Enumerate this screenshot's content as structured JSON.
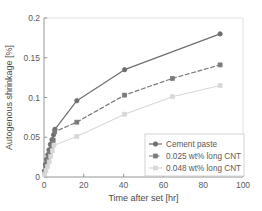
{
  "chart_data": {
    "type": "line",
    "title": "",
    "xlabel": "Time after set [hr]",
    "ylabel": "Autogenous shrinkage [%]",
    "xlim": [
      0,
      100
    ],
    "ylim": [
      0,
      0.2
    ],
    "xticks": [
      0,
      20,
      40,
      60,
      80,
      100
    ],
    "yticks": [
      0,
      0.05,
      0.1,
      0.15,
      0.2
    ],
    "xticklabels": [
      "0",
      "20",
      "40",
      "60",
      "80",
      "100"
    ],
    "yticklabels": [
      "0",
      "0.05",
      "0.1",
      "0.15",
      "0.2"
    ],
    "grid": false,
    "legend_position": "lower right",
    "series": [
      {
        "name": "Cement paste",
        "color": "#6e6e6e",
        "linestyle": "solid",
        "marker": "circle",
        "x": [
          0.3,
          0.8,
          1.3,
          1.9,
          2.5,
          3.2,
          4.0,
          4.8,
          5.5,
          16.5,
          40.5,
          88.5
        ],
        "y": [
          0.008,
          0.016,
          0.022,
          0.028,
          0.034,
          0.041,
          0.047,
          0.053,
          0.06,
          0.096,
          0.135,
          0.18
        ]
      },
      {
        "name": "0.025 wt% long CNT",
        "color": "#7a7a7a",
        "linestyle": "dashed",
        "marker": "square",
        "x": [
          0.3,
          0.9,
          1.5,
          2.2,
          3.0,
          3.8,
          4.6,
          5.4,
          16.5,
          40.5,
          64.5,
          88.5
        ],
        "y": [
          0.006,
          0.013,
          0.019,
          0.025,
          0.031,
          0.038,
          0.046,
          0.057,
          0.069,
          0.103,
          0.124,
          0.141
        ]
      },
      {
        "name": "0.048 wt% long CNT",
        "color": "#d8d8d8",
        "linestyle": "solid",
        "marker": "square",
        "x": [
          0.3,
          1.0,
          1.8,
          2.6,
          3.4,
          4.2,
          5.0,
          16.5,
          40.5,
          64.5,
          88.5
        ],
        "y": [
          0.003,
          0.008,
          0.013,
          0.019,
          0.026,
          0.033,
          0.04,
          0.051,
          0.079,
          0.101,
          0.115
        ]
      }
    ]
  },
  "legend": {
    "entries": [
      {
        "label": "Cement paste"
      },
      {
        "label": "0.025 wt% long CNT"
      },
      {
        "label": "0.048 wt% long CNT"
      }
    ]
  },
  "colors": {
    "axis": "#8a8a8a",
    "text": "#5a5a5a",
    "series1": "#6e6e6e",
    "series2": "#7a7a7a",
    "series3": "#d8d8d8",
    "legend_border": "#c8c8c8",
    "background": "#ffffff"
  }
}
